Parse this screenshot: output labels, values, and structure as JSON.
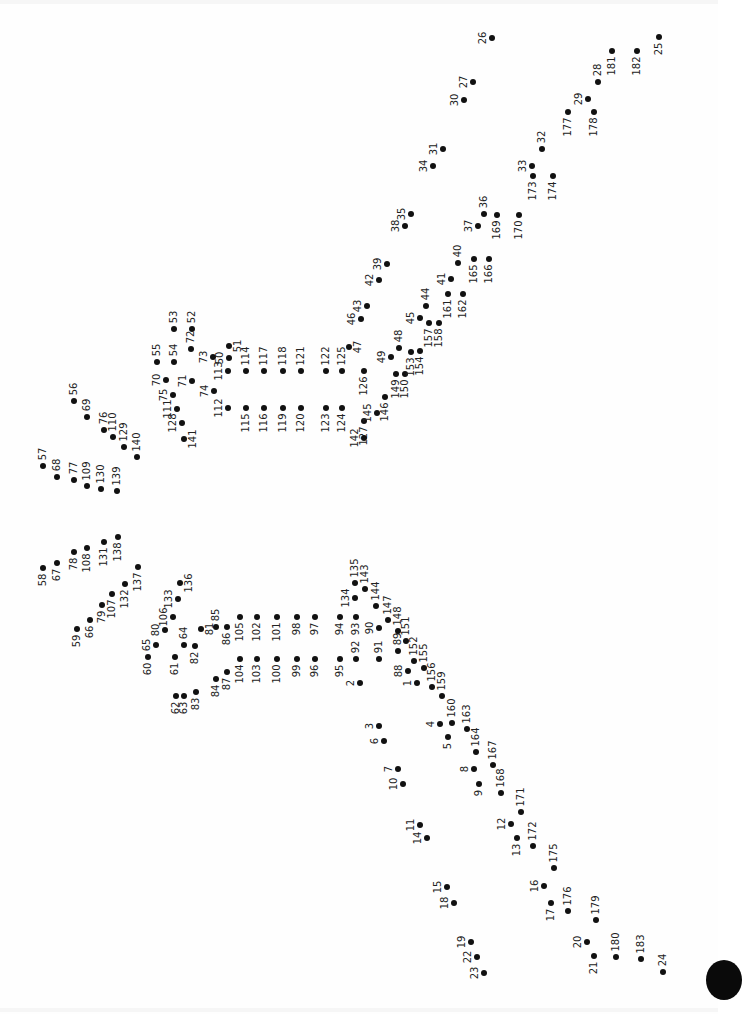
{
  "puzzle": {
    "type": "connect-the-dots",
    "total_dots": 183,
    "label_orientation": "rotated -90deg",
    "dot_color": "#111111",
    "label_color": "#222222",
    "dots": [
      {
        "n": "1",
        "x": 417,
        "y": 683,
        "d": "L"
      },
      {
        "n": "2",
        "x": 360,
        "y": 683,
        "d": "L"
      },
      {
        "n": "3",
        "x": 379,
        "y": 726,
        "d": "L"
      },
      {
        "n": "4",
        "x": 440,
        "y": 724,
        "d": "L"
      },
      {
        "n": "5",
        "x": 448,
        "y": 737,
        "d": "D"
      },
      {
        "n": "6",
        "x": 384,
        "y": 741,
        "d": "L"
      },
      {
        "n": "7",
        "x": 398,
        "y": 769,
        "d": "L"
      },
      {
        "n": "8",
        "x": 474,
        "y": 769,
        "d": "L"
      },
      {
        "n": "9",
        "x": 479,
        "y": 784,
        "d": "D"
      },
      {
        "n": "10",
        "x": 403,
        "y": 784,
        "d": "L"
      },
      {
        "n": "11",
        "x": 420,
        "y": 825,
        "d": "L"
      },
      {
        "n": "12",
        "x": 511,
        "y": 824,
        "d": "L"
      },
      {
        "n": "13",
        "x": 517,
        "y": 838,
        "d": "D"
      },
      {
        "n": "14",
        "x": 427,
        "y": 838,
        "d": "L"
      },
      {
        "n": "15",
        "x": 447,
        "y": 887,
        "d": "L"
      },
      {
        "n": "16",
        "x": 544,
        "y": 886,
        "d": "L"
      },
      {
        "n": "17",
        "x": 551,
        "y": 903,
        "d": "D"
      },
      {
        "n": "18",
        "x": 454,
        "y": 903,
        "d": "L"
      },
      {
        "n": "19",
        "x": 471,
        "y": 942,
        "d": "L"
      },
      {
        "n": "20",
        "x": 587,
        "y": 942,
        "d": "L"
      },
      {
        "n": "21",
        "x": 594,
        "y": 956,
        "d": "D"
      },
      {
        "n": "22",
        "x": 477,
        "y": 957,
        "d": "L"
      },
      {
        "n": "23",
        "x": 484,
        "y": 973,
        "d": "L"
      },
      {
        "n": "24",
        "x": 663,
        "y": 972,
        "d": "U"
      },
      {
        "n": "25",
        "x": 659,
        "y": 37,
        "d": "D"
      },
      {
        "n": "26",
        "x": 492,
        "y": 38,
        "d": "L"
      },
      {
        "n": "27",
        "x": 473,
        "y": 82,
        "d": "L"
      },
      {
        "n": "28",
        "x": 598,
        "y": 82,
        "d": "U"
      },
      {
        "n": "29",
        "x": 588,
        "y": 99,
        "d": "L"
      },
      {
        "n": "30",
        "x": 464,
        "y": 100,
        "d": "L"
      },
      {
        "n": "31",
        "x": 443,
        "y": 149,
        "d": "L"
      },
      {
        "n": "32",
        "x": 542,
        "y": 149,
        "d": "U"
      },
      {
        "n": "33",
        "x": 532,
        "y": 166,
        "d": "L"
      },
      {
        "n": "34",
        "x": 433,
        "y": 166,
        "d": "L"
      },
      {
        "n": "35",
        "x": 411,
        "y": 214,
        "d": "L"
      },
      {
        "n": "36",
        "x": 484,
        "y": 214,
        "d": "U"
      },
      {
        "n": "37",
        "x": 478,
        "y": 226,
        "d": "L"
      },
      {
        "n": "38",
        "x": 405,
        "y": 226,
        "d": "L"
      },
      {
        "n": "39",
        "x": 387,
        "y": 264,
        "d": "L"
      },
      {
        "n": "40",
        "x": 458,
        "y": 263,
        "d": "U"
      },
      {
        "n": "41",
        "x": 451,
        "y": 279,
        "d": "L"
      },
      {
        "n": "42",
        "x": 379,
        "y": 280,
        "d": "L"
      },
      {
        "n": "43",
        "x": 367,
        "y": 306,
        "d": "L"
      },
      {
        "n": "44",
        "x": 426,
        "y": 306,
        "d": "U"
      },
      {
        "n": "45",
        "x": 420,
        "y": 318,
        "d": "L"
      },
      {
        "n": "46",
        "x": 361,
        "y": 319,
        "d": "L"
      },
      {
        "n": "47",
        "x": 349,
        "y": 347,
        "d": "R"
      },
      {
        "n": "48",
        "x": 399,
        "y": 348,
        "d": "U"
      },
      {
        "n": "49",
        "x": 391,
        "y": 357,
        "d": "L"
      },
      {
        "n": "50",
        "x": 229,
        "y": 358,
        "d": "L"
      },
      {
        "n": "51",
        "x": 229,
        "y": 346,
        "d": "R"
      },
      {
        "n": "52",
        "x": 192,
        "y": 329,
        "d": "U"
      },
      {
        "n": "53",
        "x": 174,
        "y": 329,
        "d": "U"
      },
      {
        "n": "54",
        "x": 174,
        "y": 362,
        "d": "U"
      },
      {
        "n": "55",
        "x": 157,
        "y": 362,
        "d": "U"
      },
      {
        "n": "56",
        "x": 74,
        "y": 401,
        "d": "U"
      },
      {
        "n": "57",
        "x": 43,
        "y": 466,
        "d": "U"
      },
      {
        "n": "58",
        "x": 43,
        "y": 568,
        "d": "D"
      },
      {
        "n": "59",
        "x": 77,
        "y": 629,
        "d": "D"
      },
      {
        "n": "60",
        "x": 148,
        "y": 657,
        "d": "D"
      },
      {
        "n": "61",
        "x": 175,
        "y": 657,
        "d": "D"
      },
      {
        "n": "62",
        "x": 176,
        "y": 696,
        "d": "D"
      },
      {
        "n": "63",
        "x": 184,
        "y": 696,
        "d": "D"
      },
      {
        "n": "64",
        "x": 184,
        "y": 645,
        "d": "U"
      },
      {
        "n": "65",
        "x": 156,
        "y": 645,
        "d": "L"
      },
      {
        "n": "66",
        "x": 90,
        "y": 620,
        "d": "D"
      },
      {
        "n": "67",
        "x": 57,
        "y": 563,
        "d": "D"
      },
      {
        "n": "68",
        "x": 57,
        "y": 477,
        "d": "U"
      },
      {
        "n": "69",
        "x": 87,
        "y": 417,
        "d": "U"
      },
      {
        "n": "70",
        "x": 166,
        "y": 380,
        "d": "L"
      },
      {
        "n": "71",
        "x": 192,
        "y": 381,
        "d": "L"
      },
      {
        "n": "72",
        "x": 191,
        "y": 349,
        "d": "U"
      },
      {
        "n": "73",
        "x": 213,
        "y": 357,
        "d": "L"
      },
      {
        "n": "74",
        "x": 214,
        "y": 391,
        "d": "L"
      },
      {
        "n": "75",
        "x": 173,
        "y": 395,
        "d": "L"
      },
      {
        "n": "76",
        "x": 104,
        "y": 430,
        "d": "U"
      },
      {
        "n": "77",
        "x": 74,
        "y": 480,
        "d": "U"
      },
      {
        "n": "78",
        "x": 74,
        "y": 552,
        "d": "D"
      },
      {
        "n": "79",
        "x": 102,
        "y": 605,
        "d": "D"
      },
      {
        "n": "80",
        "x": 165,
        "y": 630,
        "d": "L"
      },
      {
        "n": "81",
        "x": 201,
        "y": 629,
        "d": "R"
      },
      {
        "n": "82",
        "x": 195,
        "y": 646,
        "d": "D"
      },
      {
        "n": "83",
        "x": 196,
        "y": 692,
        "d": "D"
      },
      {
        "n": "84",
        "x": 216,
        "y": 679,
        "d": "D"
      },
      {
        "n": "85",
        "x": 216,
        "y": 627,
        "d": "U"
      },
      {
        "n": "86",
        "x": 227,
        "y": 627,
        "d": "D"
      },
      {
        "n": "87",
        "x": 227,
        "y": 672,
        "d": "D"
      },
      {
        "n": "88",
        "x": 408,
        "y": 671,
        "d": "L"
      },
      {
        "n": "89",
        "x": 398,
        "y": 651,
        "d": "U"
      },
      {
        "n": "90",
        "x": 379,
        "y": 628,
        "d": "L"
      },
      {
        "n": "91",
        "x": 379,
        "y": 659,
        "d": "U"
      },
      {
        "n": "92",
        "x": 356,
        "y": 659,
        "d": "U"
      },
      {
        "n": "93",
        "x": 356,
        "y": 617,
        "d": "D"
      },
      {
        "n": "94",
        "x": 340,
        "y": 617,
        "d": "D"
      },
      {
        "n": "95",
        "x": 340,
        "y": 659,
        "d": "D"
      },
      {
        "n": "96",
        "x": 315,
        "y": 659,
        "d": "D"
      },
      {
        "n": "97",
        "x": 315,
        "y": 617,
        "d": "D"
      },
      {
        "n": "98",
        "x": 297,
        "y": 617,
        "d": "D"
      },
      {
        "n": "99",
        "x": 297,
        "y": 659,
        "d": "D"
      },
      {
        "n": "100",
        "x": 277,
        "y": 659,
        "d": "D"
      },
      {
        "n": "101",
        "x": 277,
        "y": 617,
        "d": "D"
      },
      {
        "n": "102",
        "x": 257,
        "y": 617,
        "d": "D"
      },
      {
        "n": "103",
        "x": 257,
        "y": 659,
        "d": "D"
      },
      {
        "n": "104",
        "x": 240,
        "y": 659,
        "d": "D"
      },
      {
        "n": "105",
        "x": 240,
        "y": 617,
        "d": "D"
      },
      {
        "n": "106",
        "x": 173,
        "y": 617,
        "d": "L"
      },
      {
        "n": "107",
        "x": 112,
        "y": 594,
        "d": "D"
      },
      {
        "n": "108",
        "x": 87,
        "y": 548,
        "d": "D"
      },
      {
        "n": "109",
        "x": 87,
        "y": 486,
        "d": "U"
      },
      {
        "n": "110",
        "x": 113,
        "y": 437,
        "d": "U"
      },
      {
        "n": "111",
        "x": 177,
        "y": 409,
        "d": "L"
      },
      {
        "n": "112",
        "x": 228,
        "y": 408,
        "d": "L"
      },
      {
        "n": "113",
        "x": 228,
        "y": 371,
        "d": "L"
      },
      {
        "n": "114",
        "x": 246,
        "y": 371,
        "d": "U"
      },
      {
        "n": "115",
        "x": 246,
        "y": 408,
        "d": "D"
      },
      {
        "n": "116",
        "x": 264,
        "y": 408,
        "d": "D"
      },
      {
        "n": "117",
        "x": 264,
        "y": 371,
        "d": "U"
      },
      {
        "n": "118",
        "x": 283,
        "y": 371,
        "d": "U"
      },
      {
        "n": "119",
        "x": 283,
        "y": 408,
        "d": "D"
      },
      {
        "n": "120",
        "x": 301,
        "y": 408,
        "d": "D"
      },
      {
        "n": "121",
        "x": 301,
        "y": 371,
        "d": "U"
      },
      {
        "n": "122",
        "x": 326,
        "y": 371,
        "d": "U"
      },
      {
        "n": "123",
        "x": 326,
        "y": 408,
        "d": "D"
      },
      {
        "n": "124",
        "x": 342,
        "y": 408,
        "d": "D"
      },
      {
        "n": "125",
        "x": 342,
        "y": 371,
        "d": "U"
      },
      {
        "n": "126",
        "x": 364,
        "y": 371,
        "d": "D"
      },
      {
        "n": "127",
        "x": 364,
        "y": 421,
        "d": "D"
      },
      {
        "n": "128",
        "x": 182,
        "y": 423,
        "d": "L"
      },
      {
        "n": "129",
        "x": 124,
        "y": 447,
        "d": "U"
      },
      {
        "n": "130",
        "x": 101,
        "y": 489,
        "d": "U"
      },
      {
        "n": "131",
        "x": 104,
        "y": 542,
        "d": "D"
      },
      {
        "n": "132",
        "x": 125,
        "y": 584,
        "d": "D"
      },
      {
        "n": "133",
        "x": 178,
        "y": 599,
        "d": "L"
      },
      {
        "n": "134",
        "x": 355,
        "y": 598,
        "d": "L"
      },
      {
        "n": "135",
        "x": 355,
        "y": 583,
        "d": "U"
      },
      {
        "n": "136",
        "x": 180,
        "y": 583,
        "d": "R"
      },
      {
        "n": "137",
        "x": 138,
        "y": 567,
        "d": "D"
      },
      {
        "n": "138",
        "x": 118,
        "y": 537,
        "d": "D"
      },
      {
        "n": "139",
        "x": 117,
        "y": 491,
        "d": "U"
      },
      {
        "n": "140",
        "x": 137,
        "y": 457,
        "d": "U"
      },
      {
        "n": "141",
        "x": 184,
        "y": 439,
        "d": "R"
      },
      {
        "n": "142",
        "x": 364,
        "y": 438,
        "d": "L"
      },
      {
        "n": "143",
        "x": 365,
        "y": 589,
        "d": "U"
      },
      {
        "n": "144",
        "x": 376,
        "y": 606,
        "d": "U"
      },
      {
        "n": "145",
        "x": 377,
        "y": 413,
        "d": "L"
      },
      {
        "n": "146",
        "x": 385,
        "y": 397,
        "d": "D"
      },
      {
        "n": "147",
        "x": 388,
        "y": 620,
        "d": "U"
      },
      {
        "n": "148",
        "x": 398,
        "y": 631,
        "d": "U"
      },
      {
        "n": "149",
        "x": 396,
        "y": 374,
        "d": "D"
      },
      {
        "n": "150",
        "x": 405,
        "y": 374,
        "d": "D"
      },
      {
        "n": "151",
        "x": 406,
        "y": 641,
        "d": "U"
      },
      {
        "n": "152",
        "x": 414,
        "y": 661,
        "d": "U"
      },
      {
        "n": "153",
        "x": 411,
        "y": 352,
        "d": "D"
      },
      {
        "n": "154",
        "x": 420,
        "y": 351,
        "d": "D"
      },
      {
        "n": "155",
        "x": 424,
        "y": 668,
        "d": "U"
      },
      {
        "n": "156",
        "x": 432,
        "y": 687,
        "d": "U"
      },
      {
        "n": "157",
        "x": 429,
        "y": 323,
        "d": "D"
      },
      {
        "n": "158",
        "x": 439,
        "y": 323,
        "d": "D"
      },
      {
        "n": "159",
        "x": 442,
        "y": 696,
        "d": "U"
      },
      {
        "n": "160",
        "x": 452,
        "y": 723,
        "d": "U"
      },
      {
        "n": "161",
        "x": 448,
        "y": 294,
        "d": "D"
      },
      {
        "n": "162",
        "x": 463,
        "y": 294,
        "d": "D"
      },
      {
        "n": "163",
        "x": 467,
        "y": 729,
        "d": "U"
      },
      {
        "n": "164",
        "x": 476,
        "y": 752,
        "d": "U"
      },
      {
        "n": "165",
        "x": 474,
        "y": 259,
        "d": "D"
      },
      {
        "n": "166",
        "x": 489,
        "y": 259,
        "d": "D"
      },
      {
        "n": "167",
        "x": 493,
        "y": 765,
        "d": "U"
      },
      {
        "n": "168",
        "x": 501,
        "y": 793,
        "d": "U"
      },
      {
        "n": "169",
        "x": 497,
        "y": 215,
        "d": "D"
      },
      {
        "n": "170",
        "x": 519,
        "y": 215,
        "d": "D"
      },
      {
        "n": "171",
        "x": 521,
        "y": 812,
        "d": "U"
      },
      {
        "n": "172",
        "x": 533,
        "y": 846,
        "d": "U"
      },
      {
        "n": "173",
        "x": 533,
        "y": 176,
        "d": "D"
      },
      {
        "n": "174",
        "x": 553,
        "y": 176,
        "d": "D"
      },
      {
        "n": "175",
        "x": 554,
        "y": 868,
        "d": "U"
      },
      {
        "n": "176",
        "x": 568,
        "y": 911,
        "d": "U"
      },
      {
        "n": "177",
        "x": 568,
        "y": 112,
        "d": "D"
      },
      {
        "n": "178",
        "x": 594,
        "y": 112,
        "d": "D"
      },
      {
        "n": "179",
        "x": 596,
        "y": 920,
        "d": "U"
      },
      {
        "n": "180",
        "x": 616,
        "y": 957,
        "d": "U"
      },
      {
        "n": "181",
        "x": 612,
        "y": 51,
        "d": "D"
      },
      {
        "n": "182",
        "x": 637,
        "y": 51,
        "d": "D"
      },
      {
        "n": "183",
        "x": 641,
        "y": 959,
        "d": "U"
      }
    ]
  }
}
